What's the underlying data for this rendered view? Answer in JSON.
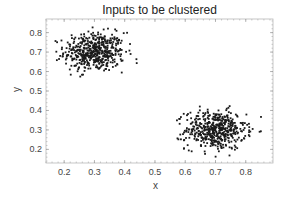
{
  "chart_data": {
    "type": "scatter",
    "title": "Inputs to be clustered",
    "xlabel": "x",
    "ylabel": "y",
    "xlim": [
      0.14,
      0.89
    ],
    "ylim": [
      0.13,
      0.87
    ],
    "xticks": [
      0.2,
      0.3,
      0.4,
      0.5,
      0.6,
      0.7,
      0.8
    ],
    "yticks": [
      0.2,
      0.3,
      0.4,
      0.5,
      0.6,
      0.7,
      0.8
    ],
    "xtick_labels": [
      "0.2",
      "0.3",
      "0.4",
      "0.5",
      "0.6",
      "0.7",
      "0.8"
    ],
    "ytick_labels": [
      "0.2",
      "0.3",
      "0.4",
      "0.5",
      "0.6",
      "0.7",
      "0.8"
    ],
    "grid": false,
    "legend": null,
    "marker_color": "#1a1a1a",
    "series": [
      {
        "name": "cluster-1",
        "center": [
          0.3,
          0.7
        ],
        "std": [
          0.05,
          0.05
        ],
        "count": 500,
        "x_range": [
          0.17,
          0.46
        ],
        "y_range": [
          0.56,
          0.84
        ]
      },
      {
        "name": "cluster-2",
        "center": [
          0.7,
          0.3
        ],
        "std": [
          0.05,
          0.05
        ],
        "count": 500,
        "x_range": [
          0.57,
          0.86
        ],
        "y_range": [
          0.16,
          0.44
        ]
      }
    ]
  }
}
